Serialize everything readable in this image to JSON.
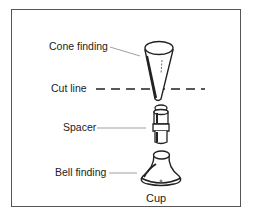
{
  "diagram": {
    "labels": {
      "cone": "Cone finding",
      "cut": "Cut line",
      "spacer": "Spacer",
      "bell": "Bell finding",
      "cup": "Cup"
    },
    "colors": {
      "stroke": "#222222",
      "frame": "#555555",
      "leader": "#777777"
    }
  }
}
